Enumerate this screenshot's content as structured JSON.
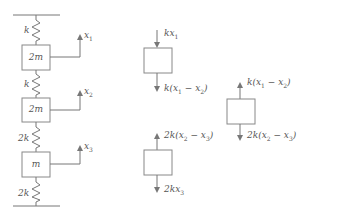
{
  "diagram": {
    "type": "spring-mass system with free body diagrams",
    "colors": {
      "line": "#777777",
      "box": "#888888",
      "text": "#555555",
      "background": "#ffffff"
    },
    "system": {
      "springs": [
        {
          "id": "s1",
          "label": "k"
        },
        {
          "id": "s2",
          "label": "k"
        },
        {
          "id": "s3",
          "label": "2k"
        },
        {
          "id": "s4",
          "label": "2k"
        }
      ],
      "masses": [
        {
          "id": "m1",
          "label": "2m",
          "displacement": "x1"
        },
        {
          "id": "m2",
          "label": "2m",
          "displacement": "x2"
        },
        {
          "id": "m3",
          "label": "m",
          "displacement": "x3"
        }
      ]
    },
    "fbd": [
      {
        "id": "fbd1",
        "top_force": "kx1",
        "top_dir": "down",
        "bottom_force": "k(x1 − x2)",
        "bottom_dir": "down"
      },
      {
        "id": "fbd2",
        "top_force": "k(x1 − x2)",
        "top_dir": "up",
        "bottom_force": "2k(x2 − x3)",
        "bottom_dir": "down"
      },
      {
        "id": "fbd3",
        "top_force": "2k(x2 − x3)",
        "top_dir": "up",
        "bottom_force": "2kx3",
        "bottom_dir": "down"
      }
    ]
  }
}
